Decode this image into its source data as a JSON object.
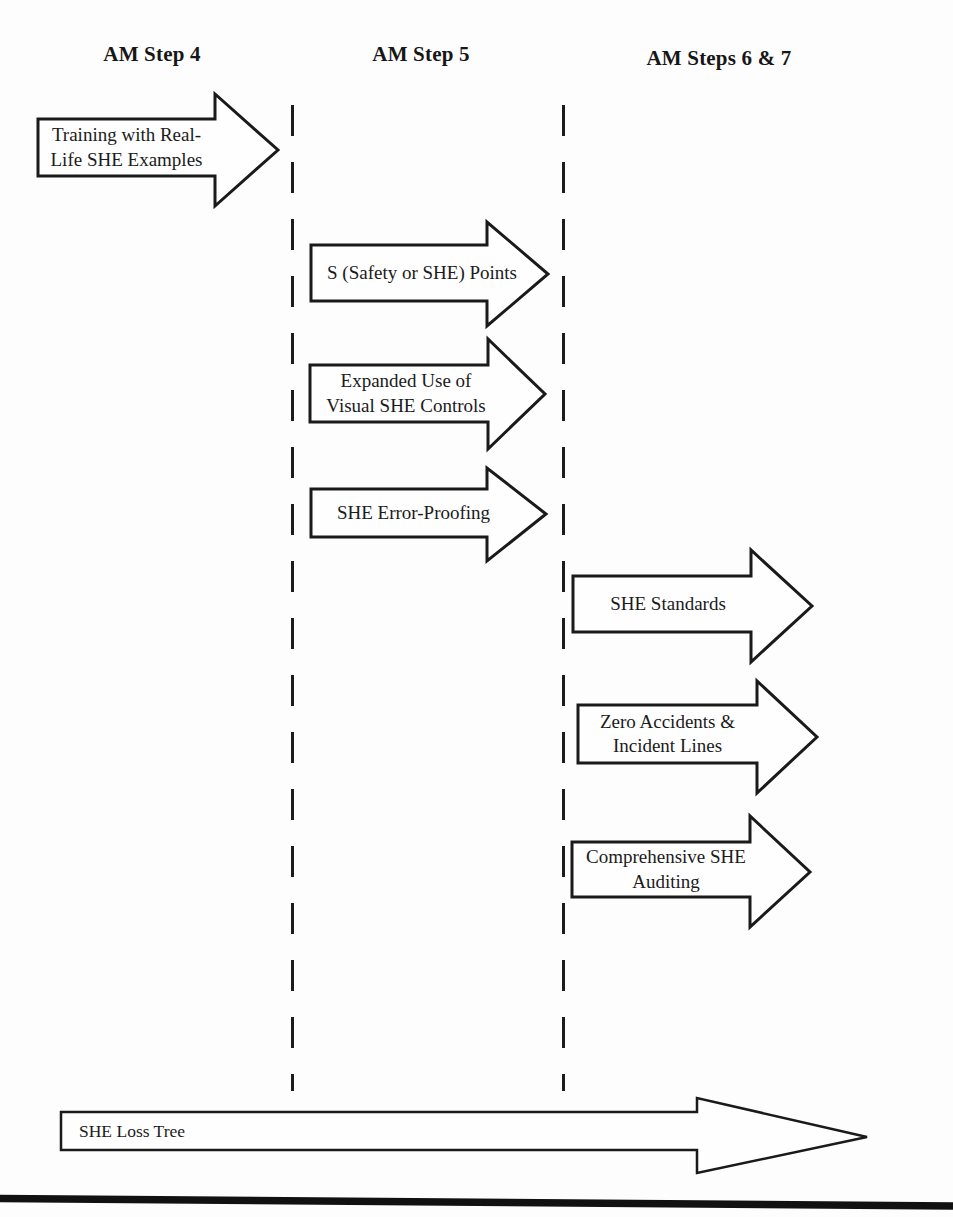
{
  "colors": {
    "ink": "#1a1a1a",
    "background": "#fdfdfd",
    "arrow_fill": "#fefefe"
  },
  "columns": [
    {
      "label": "AM Step 4"
    },
    {
      "label": "AM Step 5"
    },
    {
      "label": "AM Steps 6 & 7"
    }
  ],
  "arrows": {
    "training": {
      "label": "Training with Real-\nLife SHE Examples",
      "column": "AM Step 4"
    },
    "s_points": {
      "label": "S (Safety or SHE) Points",
      "column": "AM Step 5"
    },
    "visual_controls": {
      "label": "Expanded Use of\nVisual SHE Controls",
      "column": "AM Step 5"
    },
    "error_proofing": {
      "label": "SHE Error-Proofing",
      "column": "AM Step 5"
    },
    "standards": {
      "label": "SHE Standards",
      "column": "AM Steps 6 & 7"
    },
    "zero_accidents": {
      "label": "Zero Accidents &\nIncident Lines",
      "column": "AM Steps 6 & 7"
    },
    "auditing": {
      "label": "Comprehensive SHE\nAuditing",
      "column": "AM Steps 6 & 7"
    },
    "loss_tree": {
      "label": "SHE Loss Tree",
      "column": "all"
    }
  }
}
